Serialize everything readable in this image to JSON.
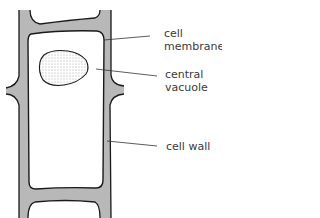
{
  "diagram": {
    "labels": [
      {
        "id": "cell-membrane",
        "lines": [
          "cell",
          "membrane"
        ]
      },
      {
        "id": "central-vacuole",
        "lines": [
          "central",
          "vacuole"
        ]
      },
      {
        "id": "cell-wall",
        "lines": [
          "cell wall"
        ]
      }
    ],
    "colors": {
      "wall_fill": "#b8b8b8",
      "outline": "#1a1a1a",
      "leader": "#333333",
      "text": "#3a3a3a"
    }
  }
}
